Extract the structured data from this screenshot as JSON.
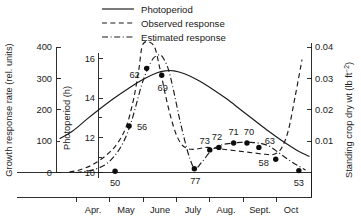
{
  "chart_data": {
    "type": "line",
    "title": "",
    "xlabel": "",
    "grid": false,
    "legend_position": "top-center",
    "x_axis": {
      "tick_labels": [
        "Apr.",
        "May",
        "June",
        "July",
        "Aug.",
        "Sept.",
        "Oct"
      ],
      "tick_positions": [
        4,
        5,
        6,
        7,
        8,
        9,
        10
      ],
      "range": [
        3.45,
        10.62
      ]
    },
    "axes": [
      {
        "id": "growth-response-rate",
        "side": "left-outer",
        "label": "Growth response rate (rel. units)",
        "ticks": [
          0,
          100,
          200,
          300,
          400
        ],
        "tick_labels": [
          "0",
          "100",
          "200",
          "300",
          "400"
        ],
        "range": [
          0,
          400
        ]
      },
      {
        "id": "photoperiod",
        "side": "left-inner",
        "label": "Photoperiod (h)",
        "ticks": [
          10,
          11,
          12,
          13,
          14,
          15,
          16
        ],
        "tick_labels": [
          "10",
          "",
          "12",
          "",
          "14",
          "",
          "16"
        ],
        "major_ticks": [
          10,
          12,
          14,
          16
        ],
        "range": [
          9.25,
          16.75
        ]
      },
      {
        "id": "standing-crop-dry-wt",
        "side": "right",
        "label": "Standing crop dry wt (lb ft",
        "label_superscript": "−2",
        "label_suffix": ")",
        "ticks": [
          0.01,
          0.02,
          0.03,
          0.04
        ],
        "tick_labels": [
          "0.01",
          "0.02",
          "0.03",
          "0.04"
        ],
        "range": [
          0,
          0.0455
        ]
      }
    ],
    "series": [
      {
        "name": "Photoperiod",
        "style": "solid",
        "axis": "photoperiod",
        "x": [
          3.45,
          3.8,
          4.2,
          4.6,
          5.0,
          5.4,
          5.8,
          6.2,
          6.45,
          6.7,
          7.0,
          7.4,
          7.8,
          8.2,
          8.6,
          9.0,
          9.4,
          9.8,
          10.2,
          10.55
        ],
        "values": [
          11.62,
          12.05,
          12.75,
          13.42,
          14.05,
          14.62,
          15.15,
          15.55,
          15.68,
          15.68,
          15.5,
          15.1,
          14.58,
          14.0,
          13.35,
          12.7,
          12.05,
          11.45,
          10.92,
          10.55
        ]
      },
      {
        "name": "Observed response",
        "style": "dashed",
        "axis": "growth-response-rate",
        "x": [
          3.72,
          4.0,
          4.4,
          4.8,
          5.1,
          5.35,
          5.55,
          5.7,
          5.82,
          5.95,
          6.12,
          6.3,
          6.45,
          6.6,
          6.75,
          6.9,
          7.05,
          7.2,
          7.35,
          7.5,
          7.65,
          7.85,
          8.1,
          8.4,
          8.7,
          9.0,
          9.3,
          9.55,
          9.75,
          9.95,
          10.15,
          10.35,
          10.5
        ],
        "values": [
          2,
          8,
          26,
          58,
          95,
          150,
          235,
          330,
          410,
          430,
          405,
          330,
          250,
          180,
          125,
          92,
          78,
          74,
          75,
          78,
          80,
          78,
          74,
          70,
          66,
          62,
          58,
          58,
          75,
          130,
          240,
          360,
          430
        ]
      },
      {
        "name": "Estimated response",
        "style": "dash-dot",
        "axis": "growth-response-rate",
        "x": [
          3.9,
          4.3,
          4.7,
          5.0,
          5.25,
          5.45,
          5.62,
          5.78,
          5.95,
          6.12,
          6.3,
          6.42,
          6.55,
          6.7,
          6.85,
          7.0,
          7.15,
          7.3,
          7.5,
          7.75,
          8.0,
          8.3,
          8.6,
          8.9,
          9.2,
          9.45,
          9.7,
          9.95,
          10.2,
          10.45
        ],
        "values": [
          0,
          6,
          22,
          52,
          95,
          150,
          215,
          280,
          330,
          365,
          375,
          360,
          325,
          255,
          175,
          105,
          45,
          12,
          34,
          68,
          86,
          93,
          96,
          96,
          92,
          82,
          62,
          42,
          24,
          8
        ]
      }
    ],
    "data_points": [
      {
        "label": "50",
        "x": 5.02,
        "value": 4,
        "axis": "growth-response-rate",
        "label_dx": 0,
        "label_dy": 15
      },
      {
        "label": "56",
        "x": 5.42,
        "value": 148,
        "axis": "growth-response-rate",
        "label_dx": 13,
        "label_dy": 4
      },
      {
        "label": "62",
        "x": 5.92,
        "value": 332,
        "axis": "growth-response-rate",
        "label_dx": -12,
        "label_dy": 10
      },
      {
        "label": "69",
        "x": 6.35,
        "value": 310,
        "axis": "growth-response-rate",
        "label_dx": 1,
        "label_dy": 16
      },
      {
        "label": "77",
        "x": 7.28,
        "value": 12,
        "axis": "growth-response-rate",
        "label_dx": 1,
        "label_dy": 15
      },
      {
        "label": "73",
        "x": 7.72,
        "value": 72,
        "axis": "growth-response-rate",
        "label_dx": -5,
        "label_dy": -6
      },
      {
        "label": "72",
        "x": 7.98,
        "value": 80,
        "axis": "growth-response-rate",
        "label_dx": -2,
        "label_dy": -7
      },
      {
        "label": "71",
        "x": 8.4,
        "value": 94,
        "axis": "growth-response-rate",
        "label_dx": 0,
        "label_dy": -8
      },
      {
        "label": "70",
        "x": 8.78,
        "value": 94,
        "axis": "growth-response-rate",
        "label_dx": 2,
        "label_dy": -8
      },
      {
        "label": "63",
        "x": 9.12,
        "value": 80,
        "axis": "growth-response-rate",
        "label_dx": 11,
        "label_dy": -3
      },
      {
        "label": "58",
        "x": 9.6,
        "value": 42,
        "axis": "growth-response-rate",
        "label_dx": -12,
        "label_dy": 7
      },
      {
        "label": "53",
        "x": 10.26,
        "value": 6,
        "axis": "growth-response-rate",
        "label_dx": 0,
        "label_dy": 15
      }
    ],
    "legend": [
      {
        "label": "Photoperiod",
        "style": "solid"
      },
      {
        "label": "Observed response",
        "style": "dashed"
      },
      {
        "label": "Estimated response",
        "style": "dash-dot"
      }
    ]
  }
}
